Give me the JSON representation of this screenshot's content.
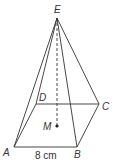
{
  "diagram": {
    "type": "square pyramid",
    "colors": {
      "stroke": "#333333",
      "background": "#ffffff"
    },
    "vertices": {
      "E": {
        "label": "E",
        "x": 57,
        "y": 18
      },
      "D": {
        "label": "D",
        "x": 36,
        "y": 104
      },
      "C": {
        "label": "C",
        "x": 99,
        "y": 104
      },
      "A": {
        "label": "A",
        "x": 14,
        "y": 147
      },
      "B": {
        "label": "B",
        "x": 77,
        "y": 147
      },
      "M": {
        "label": "M",
        "x": 57,
        "y": 126
      }
    },
    "dimension_label": "8 cm"
  }
}
